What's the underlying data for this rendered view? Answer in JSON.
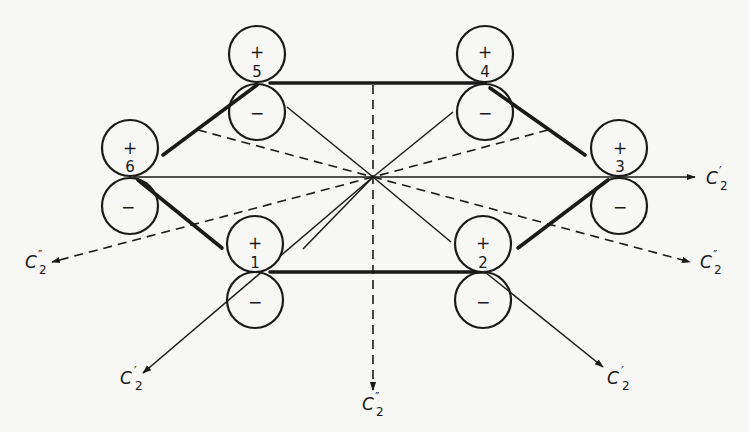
{
  "figure": {
    "colors": {
      "ink": "#1a1a1a",
      "paper": "#f7f7f5"
    }
  },
  "atoms": [
    {
      "id": "1",
      "label": "1",
      "upper_sign": "+",
      "lower_sign": "−",
      "x": 257,
      "y": 272
    },
    {
      "id": "2",
      "label": "2",
      "upper_sign": "+",
      "lower_sign": "−",
      "x": 485,
      "y": 272
    },
    {
      "id": "3",
      "label": "3",
      "upper_sign": "+",
      "lower_sign": "−",
      "x": 613,
      "y": 177
    },
    {
      "id": "4",
      "label": "4",
      "upper_sign": "+",
      "lower_sign": "−",
      "x": 485,
      "y": 83
    },
    {
      "id": "5",
      "label": "5",
      "upper_sign": "+",
      "lower_sign": "−",
      "x": 257,
      "y": 83
    },
    {
      "id": "6",
      "label": "6",
      "upper_sign": "+",
      "lower_sign": "−",
      "x": 133,
      "y": 177
    }
  ],
  "axes": [
    {
      "id": "c2p-right",
      "symbol": "C",
      "prime": "′",
      "subscript": "2",
      "style": "solid"
    },
    {
      "id": "c2p-lower-left",
      "symbol": "C",
      "prime": "′",
      "subscript": "2",
      "style": "solid"
    },
    {
      "id": "c2p-lower-right",
      "symbol": "C",
      "prime": "′",
      "subscript": "2",
      "style": "solid"
    },
    {
      "id": "c2pp-left",
      "symbol": "C",
      "prime": "″",
      "subscript": "2",
      "style": "dashed"
    },
    {
      "id": "c2pp-right",
      "symbol": "C",
      "prime": "″",
      "subscript": "2",
      "style": "dashed"
    },
    {
      "id": "c2pp-bottom",
      "symbol": "C",
      "prime": "″",
      "subscript": "2",
      "style": "dashed"
    }
  ]
}
